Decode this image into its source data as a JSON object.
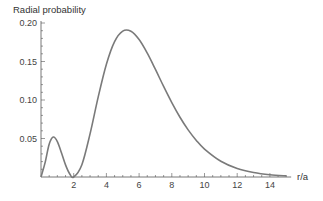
{
  "chart_data": {
    "type": "line",
    "title": "",
    "xlabel": "r/a",
    "ylabel": "Radial probability",
    "xlim": [
      0,
      15.3
    ],
    "ylim": [
      0,
      0.2
    ],
    "grid": false,
    "legend": null,
    "x_ticks": [
      2,
      4,
      6,
      8,
      10,
      12,
      14
    ],
    "x_tick_labels": [
      "2",
      "4",
      "6",
      "8",
      "10",
      "12",
      "14"
    ],
    "y_ticks": [
      0.05,
      0.1,
      0.15,
      0.2
    ],
    "y_tick_labels": [
      "0.05",
      "0.10",
      "0.15",
      "0.20"
    ],
    "series": [
      {
        "name": "Radial probability",
        "color": "#7a7a7a",
        "x": [
          0,
          0.25,
          0.5,
          0.75,
          1.0,
          1.25,
          1.5,
          1.75,
          2.0,
          2.5,
          3.0,
          3.5,
          4.0,
          4.5,
          5.0,
          5.5,
          6.0,
          6.5,
          7.0,
          7.5,
          8.0,
          8.5,
          9.0,
          9.5,
          10.0,
          11.0,
          12.0,
          13.0,
          14.0,
          15.0
        ],
        "values": [
          0,
          0.0186,
          0.0426,
          0.0519,
          0.046,
          0.0315,
          0.0157,
          0.0042,
          0,
          0.016,
          0.056,
          0.1041,
          0.1465,
          0.1758,
          0.1895,
          0.1893,
          0.1785,
          0.1608,
          0.1397,
          0.1176,
          0.0966,
          0.0776,
          0.0612,
          0.0475,
          0.0363,
          0.0205,
          0.0111,
          0.0058,
          0.0029,
          0.0015
        ]
      }
    ]
  }
}
